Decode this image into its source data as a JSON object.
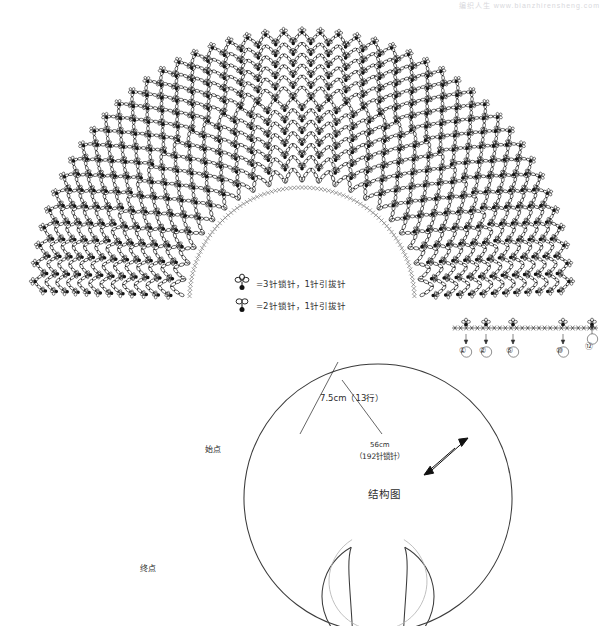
{
  "header": {
    "watermark": "编织人生 www.bianzhirensheng.com"
  },
  "chart": {
    "start_label": "始点",
    "end_label": "终点",
    "row_markers": [
      "①",
      "②",
      "⑤",
      "⑩",
      "⑫"
    ],
    "row_marker_positions": [
      463,
      483,
      510,
      560,
      589
    ]
  },
  "legend": {
    "items": [
      {
        "symbol": "picot-3",
        "text": "=3针锁针，1针引拔针"
      },
      {
        "symbol": "picot-2",
        "text": "=2针锁针，1针引拔针"
      }
    ]
  },
  "structure": {
    "title": "结构图",
    "rows_label": "7.5cm（13行）",
    "neck_label": "56cm",
    "neck_label2": "（192针锁针）"
  },
  "chart_data": {
    "type": "diagram",
    "pattern": {
      "shape": "semicircular-cape",
      "mesh_type": "chain-arc-net",
      "rings": 13,
      "inner_radius": 118,
      "outer_radius": 268,
      "center_x": 302,
      "center_y": 300,
      "angle_start_deg": 182,
      "angle_end_deg": 358,
      "cells_first_ring": 22,
      "picot_symbol_count_per_intersection": 1
    },
    "structure_diagram": {
      "outer_diameter_label": "7.5cm（13行）",
      "neck_circumference_cm": 56,
      "neck_chain_stitches": 192,
      "rows": 13,
      "row_depth_cm": 7.5
    },
    "legend_entries": [
      {
        "label": "=3针锁针，1针引拔针",
        "meaning": "3 chain stitches, 1 slip stitch (3-ch picot)"
      },
      {
        "label": "=2针锁针，1针引拔针",
        "meaning": "2 chain stitches, 1 slip stitch (2-ch picot)"
      }
    ]
  }
}
